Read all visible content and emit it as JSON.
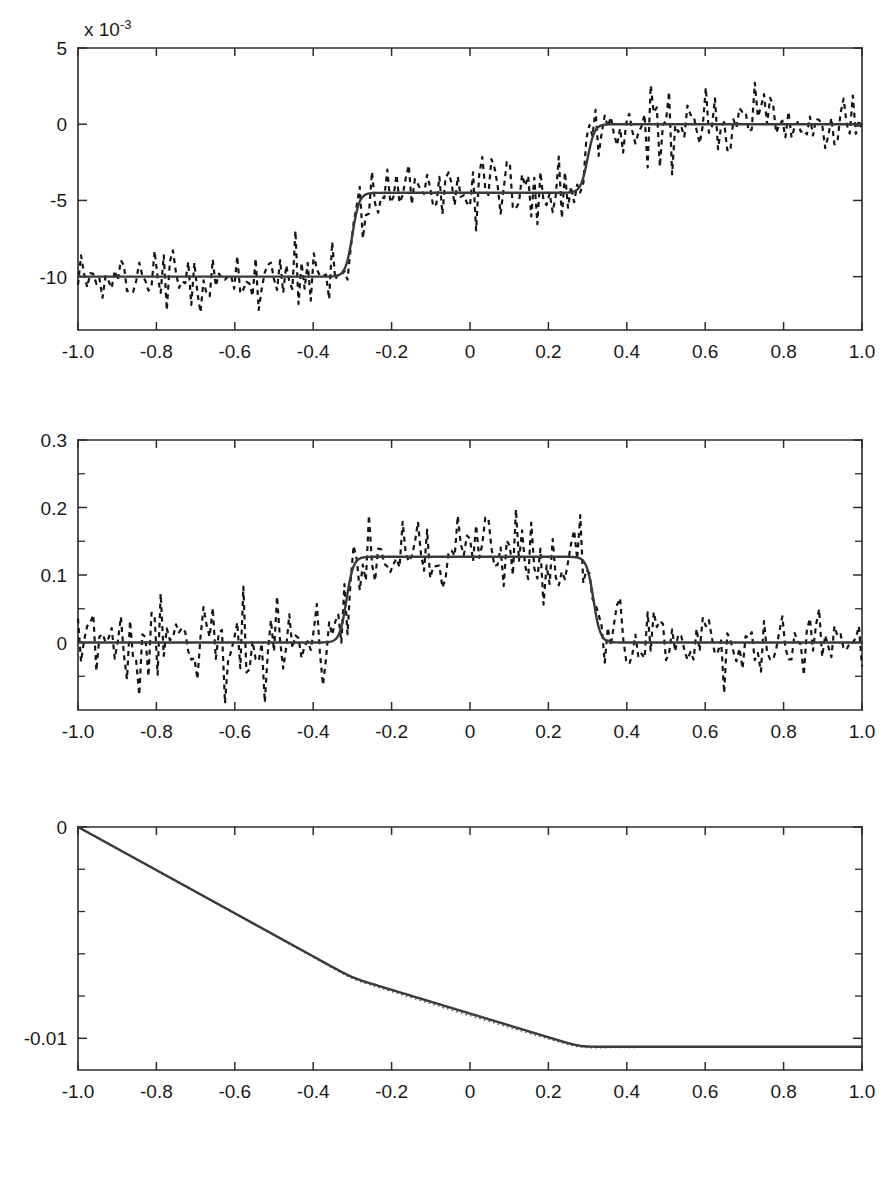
{
  "figure": {
    "background": "#ffffff",
    "width": 894,
    "height": 1177,
    "solid_color": "#3a3a3a",
    "dashed_color": "#141414",
    "dotted_color": "#5a5a5a"
  },
  "chart_data": [
    {
      "id": "panel-1",
      "type": "line",
      "title": "",
      "xlabel": "",
      "ylabel": "",
      "y_exponent_label": "x 10",
      "y_exponent_power": "-3",
      "xlim": [
        -1.0,
        1.0
      ],
      "ylim": [
        -13.5,
        5.0
      ],
      "xticks": [
        -1.0,
        -0.8,
        -0.6,
        -0.4,
        -0.2,
        0,
        0.2,
        0.4,
        0.6,
        0.8,
        1.0
      ],
      "xticklabels": [
        "-1.0",
        "-0.8",
        "-0.6",
        "-0.4",
        "-0.2",
        "0",
        "0.2",
        "0.4",
        "0.6",
        "0.8",
        "1.0"
      ],
      "yticks": [
        5,
        0,
        -5,
        -10
      ],
      "yticklabels": [
        "5",
        "0",
        "-5",
        "-10"
      ],
      "grid": false,
      "legend": "none",
      "series": [
        {
          "name": "estimate-solid",
          "style": "solid",
          "description": "smooth staircase: plateau at -10 for x<-0.33, transition to -4.5 near x=-0.29, plateau at -4.5, transition to 0 near x=0.30, plateau at 0",
          "levels": [
            -10.0,
            -4.5,
            0.0
          ],
          "step_centers": [
            -0.3,
            0.3
          ],
          "step_width": 0.035
        },
        {
          "name": "noisy-measurement-dashed",
          "style": "dashed",
          "description": "underlying staircase plus high-frequency zero-mean noise, std about 1.1 in 10^-3 units",
          "noise_std": 1.1,
          "samples": 256
        }
      ]
    },
    {
      "id": "panel-2",
      "type": "line",
      "title": "",
      "xlabel": "",
      "ylabel": "",
      "xlim": [
        -1.0,
        1.0
      ],
      "ylim": [
        -0.1,
        0.3
      ],
      "xticks": [
        -1.0,
        -0.8,
        -0.6,
        -0.4,
        -0.2,
        0,
        0.2,
        0.4,
        0.6,
        0.8,
        1.0
      ],
      "xticklabels": [
        "-1.0",
        "-0.8",
        "-0.6",
        "-0.4",
        "-0.2",
        "0",
        "0.2",
        "0.4",
        "0.6",
        "0.8",
        "1.0"
      ],
      "yticks": [
        0.3,
        0.2,
        0.1,
        0
      ],
      "yticklabels": [
        "0.3",
        "0.2",
        "0.1",
        "0"
      ],
      "yminorticks": [
        0.25,
        0.15,
        0.05,
        -0.05
      ],
      "grid": false,
      "legend": "none",
      "series": [
        {
          "name": "estimate-solid",
          "style": "solid",
          "description": "smooth rectangular pulse: baseline 0, rises near x=-0.32 to plateau 0.127, falls near x=0.31 back to 0",
          "baseline": 0.0,
          "plateau": 0.127,
          "rise_center": -0.315,
          "fall_center": 0.315,
          "edge_width": 0.035
        },
        {
          "name": "noisy-measurement-dashed",
          "style": "dashed",
          "description": "pulse plus zero-mean noise, std about 0.030",
          "noise_std": 0.03,
          "samples": 256
        }
      ]
    },
    {
      "id": "panel-3",
      "type": "line",
      "title": "",
      "xlabel": "",
      "ylabel": "",
      "xlim": [
        -1.0,
        1.0
      ],
      "ylim": [
        -0.0115,
        0.0
      ],
      "xticks": [
        -1.0,
        -0.8,
        -0.6,
        -0.4,
        -0.2,
        0,
        0.2,
        0.4,
        0.6,
        0.8,
        1.0
      ],
      "xticklabels": [
        "-1.0",
        "-0.8",
        "-0.6",
        "-0.4",
        "-0.2",
        "0",
        "0.2",
        "0.4",
        "0.6",
        "0.8",
        "1.0"
      ],
      "yticks": [
        0,
        -0.01
      ],
      "yticklabels": [
        "0",
        "-0.01"
      ],
      "yminorticks": [
        -0.002,
        -0.004,
        -0.006,
        -0.008
      ],
      "grid": false,
      "legend": "none",
      "series": [
        {
          "name": "cumulative-solid",
          "style": "solid",
          "description": "monotone decreasing integral of the staircase: steep linear fall from 0 at x=-1 to about -0.0067 at x=-0.3, gentler fall to -0.0103 at x=0.28, then flat",
          "points": [
            [
              -1.0,
              0.0
            ],
            [
              -0.8,
              -0.0019
            ],
            [
              -0.6,
              -0.0038
            ],
            [
              -0.4,
              -0.0057
            ],
            [
              -0.3,
              -0.0067
            ],
            [
              -0.2,
              -0.0076
            ],
            [
              0.0,
              -0.0088
            ],
            [
              0.2,
              -0.0099
            ],
            [
              0.28,
              -0.0103
            ],
            [
              0.4,
              -0.0104
            ],
            [
              0.6,
              -0.0104
            ],
            [
              0.8,
              -0.0104
            ],
            [
              1.0,
              -0.0104
            ]
          ]
        },
        {
          "name": "reference-dotted",
          "style": "dotted",
          "description": "faint dotted reference curve coinciding with the solid curve, slightly below it between x=-0.2 and x=0.3"
        }
      ]
    }
  ]
}
